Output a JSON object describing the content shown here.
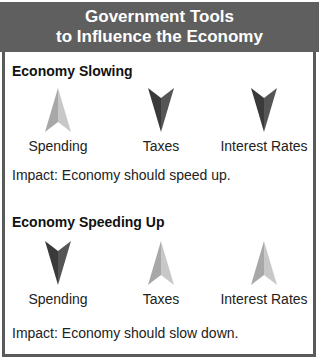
{
  "header": {
    "line1": "Government Tools",
    "line2": "to Influence the Economy"
  },
  "sections": [
    {
      "title": "Economy Slowing",
      "items": [
        {
          "label": "Spending",
          "direction": "up",
          "icon": "arrow-up-icon",
          "color": "#b5b5b5"
        },
        {
          "label": "Taxes",
          "direction": "down",
          "icon": "arrow-down-icon",
          "color": "#4a4a4a"
        },
        {
          "label": "Interest Rates",
          "direction": "down",
          "icon": "arrow-down-icon",
          "color": "#4a4a4a"
        }
      ],
      "impact": "Impact: Economy should speed up."
    },
    {
      "title": "Economy Speeding Up",
      "items": [
        {
          "label": "Spending",
          "direction": "down",
          "icon": "arrow-down-icon",
          "color": "#4a4a4a"
        },
        {
          "label": "Taxes",
          "direction": "up",
          "icon": "arrow-up-icon",
          "color": "#b5b5b5"
        },
        {
          "label": "Interest Rates",
          "direction": "up",
          "icon": "arrow-up-icon",
          "color": "#b5b5b5"
        }
      ],
      "impact": "Impact: Economy should slow down."
    }
  ],
  "colors": {
    "header_bg": "#5f5f5f",
    "border": "#5a5a5a",
    "arrow_up": "#b5b5b5",
    "arrow_down": "#4a4a4a"
  }
}
